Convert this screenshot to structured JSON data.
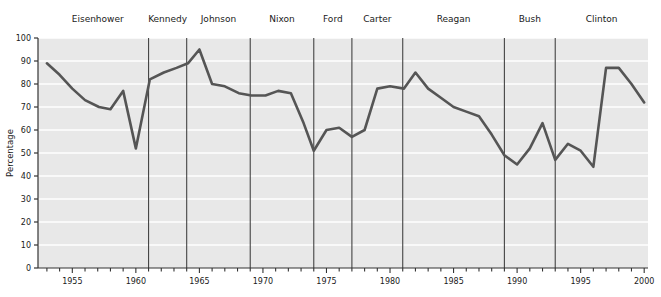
{
  "chart_data": {
    "type": "line",
    "title": "",
    "xlabel": "",
    "ylabel": "Percentage",
    "xlim": [
      1952.3,
      2000.3
    ],
    "ylim": [
      0,
      100
    ],
    "grid": true,
    "grid_axis": "y",
    "legend": "none",
    "plot_bg": "#e8e8e8",
    "grid_color": "#ffffff",
    "line_color": "#555555",
    "divider_color": "#444444",
    "axis_color": "#333333",
    "y_ticks": [
      0,
      10,
      20,
      30,
      40,
      50,
      60,
      70,
      80,
      90,
      100
    ],
    "x_ticks_labeled": [
      1955,
      1960,
      1965,
      1970,
      1975,
      1980,
      1985,
      1990,
      1995,
      2000
    ],
    "x_tick_step_minor": 1,
    "x": [
      1953,
      1954,
      1955,
      1956,
      1957,
      1958,
      1959,
      1960,
      1961,
      1962,
      1963,
      1964,
      1965,
      1966,
      1967,
      1968,
      1969,
      1970,
      1971,
      1972,
      1973,
      1974,
      1975,
      1976,
      1977,
      1978,
      1979,
      1980,
      1981,
      1982,
      1983,
      1984,
      1985,
      1986,
      1987,
      1988,
      1989,
      1990,
      1991,
      1992,
      1993,
      1994,
      1995,
      1996,
      1997,
      1998,
      1999,
      2000
    ],
    "y": [
      89,
      84,
      78,
      73,
      70,
      69,
      77,
      52,
      65,
      82,
      86,
      89,
      90,
      95,
      84,
      79,
      79,
      78,
      75,
      75,
      76,
      75,
      63,
      51,
      60,
      61,
      56,
      58,
      77,
      79,
      78,
      77,
      85,
      80,
      75,
      71,
      69,
      66,
      64,
      58,
      49,
      45,
      51,
      63,
      47,
      53,
      51,
      44,
      87,
      87,
      80,
      72,
      64,
      57,
      51,
      38,
      48,
      56
    ],
    "series": [
      {
        "name": "Percentage",
        "points": [
          [
            1953.0,
            89
          ],
          [
            1954.0,
            84
          ],
          [
            1955.0,
            78
          ],
          [
            1956.0,
            73
          ],
          [
            1957.1,
            70
          ],
          [
            1958.0,
            69
          ],
          [
            1959.0,
            77
          ],
          [
            1960.0,
            52
          ],
          [
            1961.1,
            82
          ],
          [
            1962.2,
            85
          ],
          [
            1963.2,
            87
          ],
          [
            1964.1,
            89
          ],
          [
            1965.0,
            95
          ],
          [
            1966.0,
            80
          ],
          [
            1967.0,
            79
          ],
          [
            1968.1,
            76
          ],
          [
            1969.1,
            75
          ],
          [
            1970.2,
            75
          ],
          [
            1971.2,
            77
          ],
          [
            1972.2,
            76
          ],
          [
            1973.2,
            63
          ],
          [
            1974.0,
            51
          ],
          [
            1975.0,
            60
          ],
          [
            1976.0,
            61
          ],
          [
            1977.0,
            57
          ],
          [
            1978.0,
            60
          ],
          [
            1979.0,
            78
          ],
          [
            1980.0,
            79
          ],
          [
            1981.1,
            78
          ],
          [
            1982.0,
            85
          ],
          [
            1983.0,
            78
          ],
          [
            1984.0,
            74
          ],
          [
            1985.0,
            70
          ],
          [
            1986.0,
            68
          ],
          [
            1987.0,
            66
          ],
          [
            1988.0,
            58
          ],
          [
            1989.0,
            49
          ],
          [
            1990.0,
            45
          ],
          [
            1991.0,
            52
          ],
          [
            1992.0,
            63
          ],
          [
            1993.0,
            47
          ],
          [
            1994.0,
            54
          ],
          [
            1995.0,
            51
          ],
          [
            1996.0,
            44
          ],
          [
            1997.0,
            87
          ],
          [
            1998.0,
            87
          ],
          [
            1999.0,
            80
          ],
          [
            2000.0,
            72
          ]
        ]
      }
    ],
    "presidents": [
      {
        "label": "Eisenhower",
        "start": 1953.0,
        "end": 1961.0
      },
      {
        "label": "Kennedy",
        "start": 1961.0,
        "end": 1964.0
      },
      {
        "label": "Johnson",
        "start": 1964.0,
        "end": 1969.0
      },
      {
        "label": "Nixon",
        "start": 1969.0,
        "end": 1974.0
      },
      {
        "label": "Ford",
        "start": 1974.0,
        "end": 1977.0
      },
      {
        "label": "Carter",
        "start": 1977.0,
        "end": 1981.0
      },
      {
        "label": "Reagan",
        "start": 1981.0,
        "end": 1989.0
      },
      {
        "label": "Bush",
        "start": 1989.0,
        "end": 1993.0
      },
      {
        "label": "Clinton",
        "start": 1993.0,
        "end": 2000.3
      }
    ],
    "dividers": [
      1961.0,
      1964.0,
      1969.0,
      1974.0,
      1977.0,
      1981.0,
      1989.0,
      1993.0
    ],
    "annotations": []
  }
}
